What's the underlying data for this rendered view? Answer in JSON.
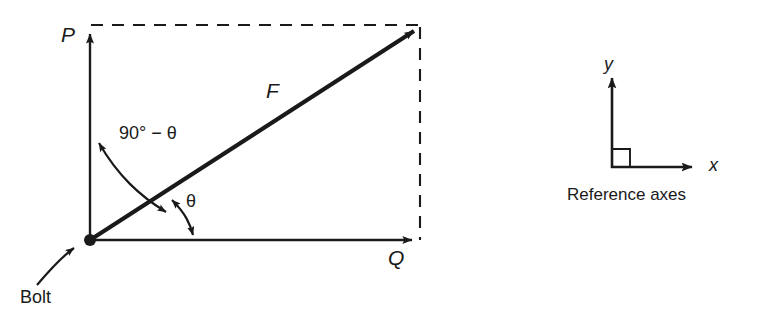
{
  "figure": {
    "background_color": "#ffffff",
    "stroke_color": "#1a1a1a",
    "main_diagram": {
      "name": "force-parallelogram",
      "origin_label": "Bolt",
      "vectors": [
        {
          "key": "P",
          "label": "P",
          "direction": "up",
          "description": "vertical component force P"
        },
        {
          "key": "Q",
          "label": "Q",
          "direction": "right",
          "description": "horizontal component force Q"
        },
        {
          "key": "F",
          "label": "F",
          "direction": "up-right",
          "description": "resultant force F"
        }
      ],
      "angles": [
        {
          "key": "theta",
          "label": "θ",
          "between": "F and Q"
        },
        {
          "key": "complement",
          "label": "90° − θ",
          "between": "F and P"
        }
      ]
    },
    "reference_axes": {
      "name": "reference-axes",
      "caption": "Reference axes",
      "x_label": "x",
      "y_label": "y",
      "right_angle_marker": true
    }
  }
}
